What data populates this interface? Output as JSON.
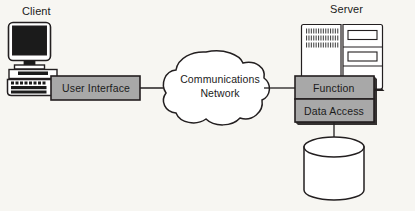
{
  "diagram": {
    "type": "client-server-architecture",
    "background_color": "#f7f6f2",
    "box_fill_color": "#a8a8a8",
    "stroke_color": "#231f20",
    "client": {
      "title": "Client",
      "computer_icon": "desktop-computer-icon",
      "layer_label": "User Interface"
    },
    "network": {
      "shape": "cloud",
      "label_line1": "Communications",
      "label_line2": "Network"
    },
    "server": {
      "title": "Server",
      "computer_icon": "server-tower-icon",
      "layers": [
        {
          "label": "Function"
        },
        {
          "label": "Data Access"
        }
      ],
      "database_icon": "database-cylinder-icon"
    },
    "connectors": [
      {
        "from": "User Interface",
        "to": "Communications Network"
      },
      {
        "from": "Communications Network",
        "to": "Function"
      },
      {
        "from": "Data Access",
        "to": "Database"
      }
    ]
  }
}
